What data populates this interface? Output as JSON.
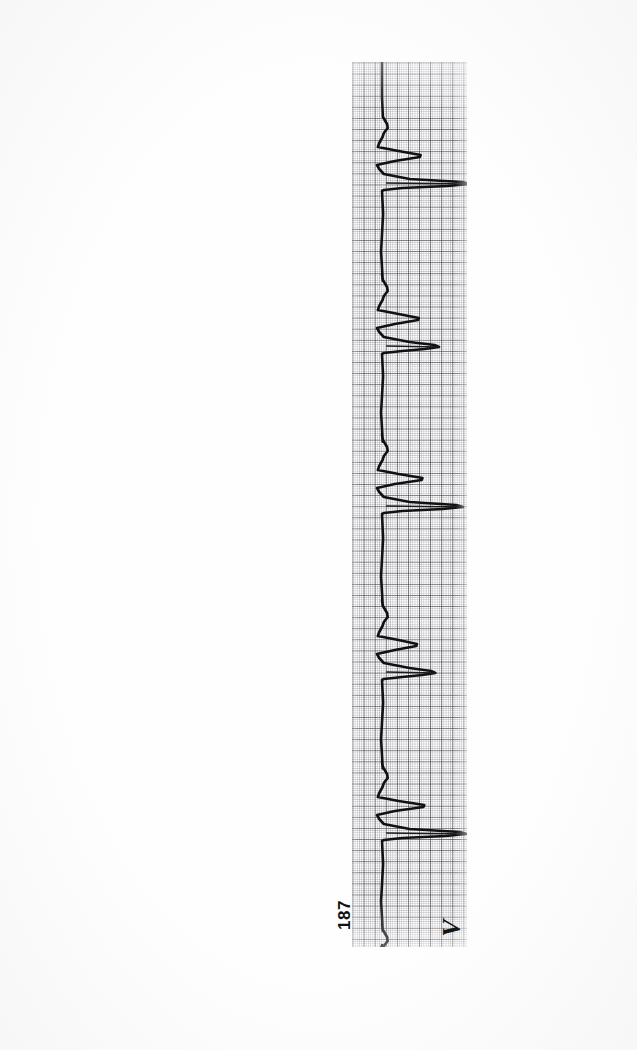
{
  "document": {
    "type": "scanned-ecg-page",
    "page_number": "187",
    "background_color": "#ffffff"
  },
  "ecg": {
    "lead_annotation": "V",
    "paper_color": "#ffffff",
    "trace_color": "#111111",
    "grid_fine_color": "#787882",
    "grid_major_color": "#3c3c46",
    "orientation": "rotated-90-ccw",
    "strip": {
      "left": 352,
      "top": 62,
      "width": 115,
      "height": 885
    },
    "baseline_offset": 30,
    "grid": {
      "fine_mm": 2.22,
      "major_mm": 11.1,
      "cells_per_major": 5
    }
  },
  "chart_data": {
    "type": "line",
    "title": "",
    "subtitle": "",
    "xlabel": "",
    "ylabel": "",
    "orientation": "vertical-rotated",
    "legend": [],
    "grid": true,
    "signal_name": "ECG lead V",
    "page_label": "187",
    "sampling_note": "25 mm/s, 10 mm/mV standard ECG graph paper",
    "beats": [
      {
        "index": 1,
        "r_peak_t": 95,
        "r_amplitude": 0.42,
        "t_amplitude": 0.95,
        "note": "partial beat at strip start"
      },
      {
        "index": 2,
        "r_peak_t": 258,
        "r_amplitude": 0.4,
        "t_amplitude": 0.62,
        "note": "wide QRS, deep S"
      },
      {
        "index": 3,
        "r_peak_t": 418,
        "r_amplitude": 0.44,
        "t_amplitude": 0.88,
        "note": "wide QRS, tall T"
      },
      {
        "index": 4,
        "r_peak_t": 584,
        "r_amplitude": 0.38,
        "t_amplitude": 0.58,
        "note": "wide QRS"
      },
      {
        "index": 5,
        "r_peak_t": 745,
        "r_amplitude": 0.46,
        "t_amplitude": 0.92,
        "note": "wide QRS, tall T"
      },
      {
        "index": 6,
        "r_peak_t": 908,
        "r_amplitude": 0.4,
        "t_amplitude": 0.6,
        "note": "partial beat at strip end"
      }
    ],
    "ylim": [
      0,
      1
    ],
    "xlim": [
      0,
      885
    ],
    "baseline_value": 0.26
  }
}
